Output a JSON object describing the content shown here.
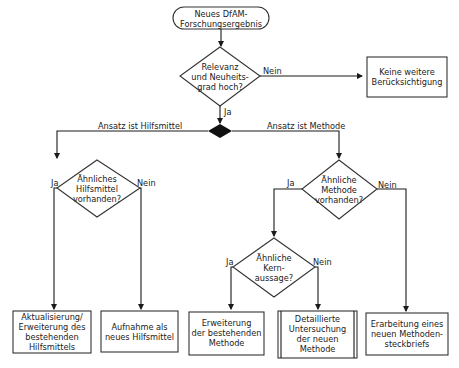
{
  "diagram": {
    "type": "flowchart",
    "start": {
      "label": "Neues DfAM-\nForschungsergebnis"
    },
    "decisions": {
      "relevance": {
        "label": "Relevanz\nund Neuheits-\ngrad hoch?"
      },
      "similar_aid": {
        "label": "Ähnliches\nHilfsmittel\nvorhanden?"
      },
      "similar_method": {
        "label": "Ähnliche\nMethode\nvorhanden?"
      },
      "similar_core": {
        "label": "Ähnliche\nKern-\naussage?"
      }
    },
    "processes": {
      "no_consideration": {
        "label": "Keine weitere\nBerücksichtigung"
      },
      "update_aid": {
        "label": "Aktualisierung/\nErweiterung des\nbestehenden\nHilfsmittels"
      },
      "new_aid": {
        "label": "Aufnahme als\nneues Hilfsmittel"
      },
      "extend_method": {
        "label": "Erweiterung\nder bestehenden\nMethode"
      },
      "investigate_method": {
        "label": "Detaillierte\nUntersuchung\nder neuen\nMethode"
      },
      "new_profile": {
        "label": "Erarbeitung eines\nneuen Methoden-\nsteckbriefs"
      }
    },
    "edges": {
      "yes": "Ja",
      "no": "Nein",
      "is_aid": "Ansatz ist Hilfsmittel",
      "is_method": "Ansatz ist Methode"
    }
  }
}
